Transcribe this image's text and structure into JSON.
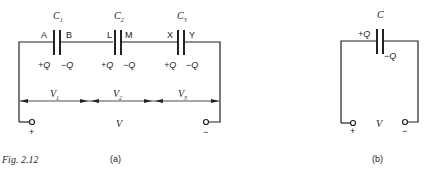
{
  "figure": {
    "caption": "Fig. 2.12",
    "panel_a_label": "(a)",
    "panel_b_label": "(b)"
  },
  "panel_a": {
    "capacitors": [
      {
        "name": "C",
        "sub": "1",
        "left_plate": "A",
        "right_plate": "B",
        "left_charge": "+Q",
        "right_charge": "−Q"
      },
      {
        "name": "C",
        "sub": "2",
        "left_plate": "L",
        "right_plate": "M",
        "left_charge": "+Q",
        "right_charge": "−Q"
      },
      {
        "name": "C",
        "sub": "3",
        "left_plate": "X",
        "right_plate": "Y",
        "left_charge": "+Q",
        "right_charge": "−Q"
      }
    ],
    "voltages": [
      {
        "name": "V",
        "sub": "1"
      },
      {
        "name": "V",
        "sub": "2"
      },
      {
        "name": "V",
        "sub": "3"
      }
    ],
    "total_voltage": "V",
    "plus_terminal": "+",
    "minus_terminal": "−"
  },
  "panel_b": {
    "capacitor": "C",
    "left_charge": "+Q",
    "right_charge": "−Q",
    "total_voltage": "V",
    "plus_terminal": "+",
    "minus_terminal": "−"
  }
}
